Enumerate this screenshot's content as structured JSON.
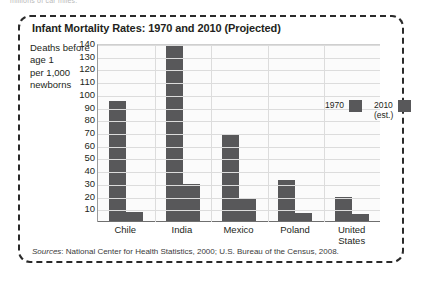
{
  "page": {
    "top_scrap_text": "millions of car miles."
  },
  "chart_data": {
    "type": "bar",
    "title": "Infant Mortality Rates: 1970 and 2010 (Projected)",
    "ylabel_lines": [
      "Deaths before",
      "age 1",
      "per 1,000",
      "newborns"
    ],
    "xlabel": "",
    "categories": [
      "Chile",
      "India",
      "Mexico",
      "Poland",
      "United States"
    ],
    "category_label_lines": [
      [
        "Chile"
      ],
      [
        "India"
      ],
      [
        "Mexico"
      ],
      [
        "Poland"
      ],
      [
        "United",
        "States"
      ]
    ],
    "series": [
      {
        "name": "1970",
        "values": [
          95,
          139,
          69,
          33,
          20
        ]
      },
      {
        "name": "2010 (est.)",
        "values": [
          8,
          30,
          19,
          7,
          6
        ]
      }
    ],
    "legend": [
      {
        "label_lines": [
          "1970"
        ],
        "color": "#58585a"
      },
      {
        "label_lines": [
          "2010",
          "(est.)"
        ],
        "color": "#58585a"
      }
    ],
    "legend_position": "inside-top-right",
    "ylim": [
      0,
      140
    ],
    "yticks": [
      10,
      20,
      30,
      40,
      50,
      60,
      70,
      80,
      90,
      100,
      110,
      120,
      130,
      140
    ],
    "ytick_labels": [
      "10",
      "20",
      "30",
      "40",
      "50",
      "60",
      "70",
      "80",
      "90",
      "100",
      "110",
      "120",
      "130",
      "140"
    ],
    "grid": true,
    "bar_color": "#58585a",
    "source": {
      "prefix": "Sources",
      "text": ": National Center for Health Statistics, 2000; U.S. Bureau of the Census, 2008."
    }
  }
}
